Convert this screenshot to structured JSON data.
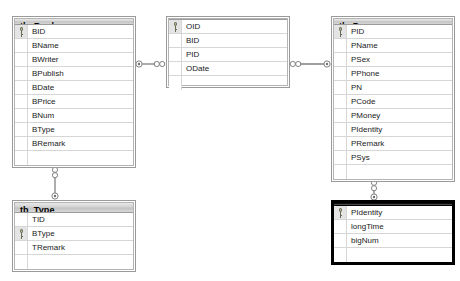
{
  "diagram": {
    "background_color": "#ffffff",
    "tables": [
      {
        "name": "tb_Book",
        "selected": false,
        "x": 12,
        "y": 16,
        "width": 124,
        "height": 152,
        "fields": [
          {
            "name": "BID",
            "primary_key": true
          },
          {
            "name": "BName",
            "primary_key": false
          },
          {
            "name": "BWriter",
            "primary_key": false
          },
          {
            "name": "BPublish",
            "primary_key": false
          },
          {
            "name": "BDate",
            "primary_key": false
          },
          {
            "name": "BPrice",
            "primary_key": false
          },
          {
            "name": "BNum",
            "primary_key": false
          },
          {
            "name": "BType",
            "primary_key": false
          },
          {
            "name": "BRemark",
            "primary_key": false
          }
        ]
      },
      {
        "name": "tb_BookOut",
        "selected": false,
        "x": 166,
        "y": 16,
        "width": 124,
        "height": 72,
        "fields": [
          {
            "name": "OID",
            "primary_key": true
          },
          {
            "name": "BID",
            "primary_key": false
          },
          {
            "name": "PID",
            "primary_key": false
          },
          {
            "name": "ODate",
            "primary_key": false
          }
        ]
      },
      {
        "name": "tb_Person",
        "selected": false,
        "x": 331,
        "y": 16,
        "width": 124,
        "height": 166,
        "fields": [
          {
            "name": "PID",
            "primary_key": true
          },
          {
            "name": "PName",
            "primary_key": false
          },
          {
            "name": "PSex",
            "primary_key": false
          },
          {
            "name": "PPhone",
            "primary_key": false
          },
          {
            "name": "PN",
            "primary_key": false
          },
          {
            "name": "PCode",
            "primary_key": false
          },
          {
            "name": "PMoney",
            "primary_key": false
          },
          {
            "name": "PIdentity",
            "primary_key": false
          },
          {
            "name": "PRemark",
            "primary_key": false
          },
          {
            "name": "PSys",
            "primary_key": false
          }
        ]
      },
      {
        "name": "tb_Type",
        "selected": false,
        "x": 12,
        "y": 200,
        "width": 124,
        "height": 72,
        "fields": [
          {
            "name": "TID",
            "primary_key": false
          },
          {
            "name": "BType",
            "primary_key": true
          },
          {
            "name": "TRemark",
            "primary_key": false
          }
        ]
      },
      {
        "name": "tb_Identity",
        "selected": true,
        "x": 331,
        "y": 200,
        "width": 124,
        "height": 65,
        "fields": [
          {
            "name": "PIdentity",
            "primary_key": true
          },
          {
            "name": "longTime",
            "primary_key": false
          },
          {
            "name": "bigNum",
            "primary_key": false
          }
        ]
      }
    ],
    "relationships": [
      {
        "name": "tb_Book-to-tb_BookOut",
        "from_table": "tb_Book",
        "to_table": "tb_BookOut",
        "orientation": "horizontal",
        "one_end": "from",
        "cardinality": "one-to-many"
      },
      {
        "name": "tb_BookOut-to-tb_Person",
        "from_table": "tb_BookOut",
        "to_table": "tb_Person",
        "orientation": "horizontal",
        "one_end": "to",
        "cardinality": "many-to-one"
      },
      {
        "name": "tb_Book-to-tb_Type",
        "from_table": "tb_Book",
        "to_table": "tb_Type",
        "orientation": "vertical",
        "one_end": "to",
        "cardinality": "many-to-one"
      },
      {
        "name": "tb_Person-to-tb_Identity",
        "from_table": "tb_Person",
        "to_table": "tb_Identity",
        "orientation": "vertical",
        "one_end": "to",
        "cardinality": "many-to-one"
      }
    ],
    "colors": {
      "header_gray": "#d2d2d2",
      "header_selected": "#0a0a0a",
      "border": "#9a9a9a",
      "row_line": "#d6d6d6",
      "connector": "#808080",
      "text": "#1a1a1a",
      "text_selected": "#ffffff"
    }
  }
}
